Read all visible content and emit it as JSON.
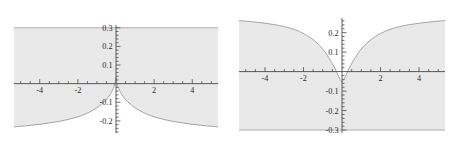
{
  "figure": {
    "title": "",
    "background": "#ffffff",
    "panel_count": 2
  },
  "style": {
    "fill_color": "#e9e9e9",
    "curve_color": "#9a9a9a",
    "axis_color": "#4a4a4a",
    "tick_color": "#4a4a4a",
    "label_color": "#2b2b2b"
  },
  "chart_data": [
    {
      "type": "area",
      "panel": "left",
      "title": "",
      "xlabel": "",
      "ylabel": "",
      "xlim": [
        -5.35,
        5.35
      ],
      "ylim": [
        -0.265,
        0.315
      ],
      "grid": false,
      "legend": null,
      "x_ticks_major": [
        -4,
        -2,
        2,
        4
      ],
      "x_tick_labels": [
        "-4",
        "-2",
        "2",
        "4"
      ],
      "x_ticks_minor_step": 0.5,
      "y_ticks_major": [
        0.3,
        0.2,
        0.1,
        -0.1,
        -0.2
      ],
      "y_tick_labels": [
        "0.3",
        "0.2",
        "0.1",
        "-0.1",
        "-0.2"
      ],
      "y_ticks_minor_step": 0.02,
      "fill_between": {
        "upper_constant": 0.3,
        "lower_series_name": "lower-boundary-curve"
      },
      "series": [
        {
          "name": "lower-boundary-curve",
          "description": "cusped peak at origin decaying to negative plateau",
          "x": [
            -5.35,
            -5.0,
            -4.5,
            -4.0,
            -3.5,
            -3.0,
            -2.5,
            -2.0,
            -1.6,
            -1.2,
            -0.9,
            -0.6,
            -0.4,
            -0.25,
            -0.15,
            -0.07,
            0.0,
            0.07,
            0.15,
            0.25,
            0.4,
            0.6,
            0.9,
            1.2,
            1.6,
            2.0,
            2.5,
            3.0,
            3.5,
            4.0,
            4.5,
            5.0,
            5.35
          ],
          "y": [
            -0.232,
            -0.229,
            -0.224,
            -0.218,
            -0.211,
            -0.203,
            -0.192,
            -0.178,
            -0.163,
            -0.142,
            -0.122,
            -0.096,
            -0.072,
            -0.048,
            -0.028,
            -0.005,
            0.031,
            -0.005,
            -0.028,
            -0.048,
            -0.072,
            -0.096,
            -0.122,
            -0.142,
            -0.163,
            -0.178,
            -0.192,
            -0.203,
            -0.211,
            -0.218,
            -0.224,
            -0.229,
            -0.232
          ]
        },
        {
          "name": "upper-boundary-line",
          "description": "horizontal line at y = 0.3",
          "x": [
            -5.35,
            5.35
          ],
          "y": [
            0.3,
            0.3
          ]
        }
      ]
    },
    {
      "type": "area",
      "panel": "right",
      "title": "",
      "xlabel": "",
      "ylabel": "",
      "xlim": [
        -5.35,
        5.35
      ],
      "ylim": [
        -0.315,
        0.275
      ],
      "grid": false,
      "legend": null,
      "x_ticks_major": [
        -4,
        -2,
        2,
        4
      ],
      "x_tick_labels": [
        "-4",
        "-2",
        "2",
        "4"
      ],
      "x_ticks_minor_step": 0.5,
      "y_ticks_major": [
        0.2,
        0.1,
        -0.1,
        -0.2,
        -0.3
      ],
      "y_tick_labels": [
        "0.2",
        "0.1",
        "-0.1",
        "-0.2",
        "-0.3"
      ],
      "y_ticks_minor_step": 0.02,
      "fill_between": {
        "lower_constant": -0.3,
        "upper_series_name": "upper-boundary-curve"
      },
      "series": [
        {
          "name": "upper-boundary-curve",
          "description": "narrow dip below zero at origin rising to positive plateau",
          "x": [
            -5.35,
            -5.0,
            -4.5,
            -4.0,
            -3.5,
            -3.0,
            -2.5,
            -2.2,
            -1.9,
            -1.6,
            -1.3,
            -1.05,
            -0.85,
            -0.65,
            -0.5,
            -0.35,
            -0.22,
            -0.1,
            0.0,
            0.1,
            0.22,
            0.35,
            0.5,
            0.65,
            0.85,
            1.05,
            1.3,
            1.6,
            1.9,
            2.2,
            2.5,
            3.0,
            3.5,
            4.0,
            4.5,
            5.0,
            5.35
          ],
          "y": [
            0.262,
            0.259,
            0.254,
            0.248,
            0.241,
            0.231,
            0.217,
            0.205,
            0.19,
            0.171,
            0.147,
            0.121,
            0.096,
            0.066,
            0.041,
            0.013,
            -0.016,
            -0.04,
            -0.052,
            -0.04,
            -0.016,
            0.013,
            0.041,
            0.066,
            0.096,
            0.121,
            0.147,
            0.171,
            0.19,
            0.205,
            0.217,
            0.231,
            0.241,
            0.248,
            0.254,
            0.259,
            0.262
          ]
        },
        {
          "name": "lower-boundary-line",
          "description": "horizontal line at y = -0.3",
          "x": [
            -5.35,
            5.35
          ],
          "y": [
            -0.3,
            -0.3
          ]
        }
      ]
    }
  ]
}
